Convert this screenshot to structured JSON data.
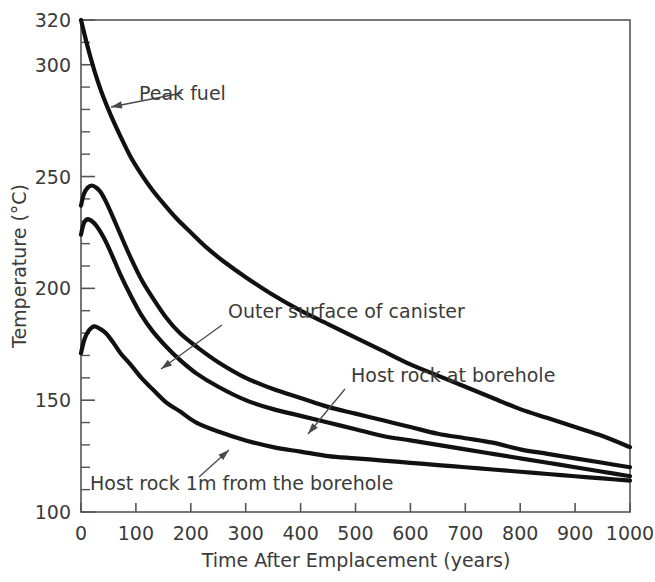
{
  "chart_data": {
    "type": "line",
    "title": "",
    "xlabel": "Time After Emplacement (years)",
    "ylabel": "Temperature (°C)",
    "xlim": [
      0,
      1000
    ],
    "ylim": [
      100,
      320
    ],
    "grid": false,
    "legend_position": "inline-annotations",
    "xticks": [
      0,
      100,
      200,
      300,
      400,
      500,
      600,
      700,
      800,
      900,
      1000
    ],
    "xtick_labels": [
      "0",
      "100",
      "200",
      "300",
      "400",
      "500",
      "600",
      "700",
      "800",
      "900",
      "1000"
    ],
    "yticks": [
      100,
      150,
      200,
      250,
      300,
      320
    ],
    "ytick_labels": [
      "100",
      "150",
      "200",
      "250",
      "300",
      "320"
    ],
    "y_minor_tick_step": 10,
    "series": [
      {
        "name": "Peak fuel",
        "color": "#111111",
        "x": [
          0,
          10,
          20,
          30,
          40,
          55,
          70,
          90,
          110,
          130,
          150,
          175,
          200,
          230,
          260,
          300,
          350,
          400,
          450,
          500,
          550,
          600,
          650,
          700,
          750,
          800,
          850,
          900,
          950,
          1000
        ],
        "y": [
          320,
          310,
          301,
          293,
          286,
          277,
          269,
          259,
          251,
          244,
          238,
          231,
          225,
          218,
          212,
          205,
          197,
          190,
          184,
          178,
          172,
          166,
          161,
          156,
          151,
          146,
          142,
          138,
          134,
          129
        ]
      },
      {
        "name": "Outer surface of canister",
        "color": "#111111",
        "x": [
          0,
          5,
          12,
          20,
          28,
          36,
          45,
          58,
          72,
          90,
          110,
          130,
          155,
          180,
          210,
          250,
          300,
          350,
          400,
          450,
          500,
          550,
          600,
          650,
          700,
          750,
          800,
          850,
          900,
          950,
          1000
        ],
        "y": [
          237,
          242,
          245,
          246,
          245,
          243,
          239,
          232,
          224,
          214,
          204,
          196,
          187,
          180,
          174,
          167,
          160,
          155,
          151,
          147,
          144,
          141,
          138,
          135,
          133,
          131,
          128,
          126,
          124,
          122,
          120
        ]
      },
      {
        "name": "Host rock at borehole",
        "color": "#111111",
        "x": [
          0,
          5,
          12,
          20,
          28,
          36,
          45,
          58,
          72,
          90,
          110,
          130,
          155,
          180,
          210,
          250,
          300,
          350,
          400,
          450,
          500,
          550,
          600,
          650,
          700,
          750,
          800,
          850,
          900,
          950,
          1000
        ],
        "y": [
          224,
          229,
          231,
          230,
          228,
          225,
          221,
          214,
          206,
          197,
          188,
          181,
          174,
          168,
          162,
          156,
          150,
          146,
          143,
          140,
          137,
          134,
          132,
          130,
          128,
          126,
          124,
          122,
          120,
          118,
          116
        ]
      },
      {
        "name": "Host rock 1m from the borehole",
        "color": "#111111",
        "x": [
          0,
          6,
          14,
          24,
          34,
          45,
          58,
          72,
          90,
          110,
          130,
          155,
          180,
          210,
          250,
          300,
          350,
          400,
          450,
          500,
          550,
          600,
          650,
          700,
          750,
          800,
          850,
          900,
          950,
          1000
        ],
        "y": [
          171,
          177,
          181,
          183,
          182,
          180,
          176,
          171,
          166,
          160,
          155,
          149,
          145,
          140,
          136,
          132,
          129,
          127,
          125,
          124,
          123,
          122,
          121,
          120,
          119,
          118,
          117,
          116,
          115,
          114
        ]
      }
    ],
    "annotations": [
      {
        "label": "Peak fuel",
        "text_x": 139,
        "text_y": 100,
        "anchor": "start",
        "arrow_from_x": 182,
        "arrow_from_y": 93,
        "arrow_to_x": 111,
        "arrow_to_y": 107
      },
      {
        "label": "Outer surface of canister",
        "text_x": 228,
        "text_y": 318,
        "anchor": "start",
        "arrow_from_x": 222,
        "arrow_from_y": 325,
        "arrow_to_x": 161,
        "arrow_to_y": 369
      },
      {
        "label": "Host rock at borehole",
        "text_x": 351,
        "text_y": 382,
        "anchor": "start",
        "arrow_from_x": 345,
        "arrow_from_y": 389,
        "arrow_to_x": 308,
        "arrow_to_y": 434
      },
      {
        "label": "Host rock 1m from the borehole",
        "text_x": 90,
        "text_y": 490,
        "anchor": "start",
        "arrow_from_x": 199,
        "arrow_from_y": 477,
        "arrow_to_x": 229,
        "arrow_to_y": 450
      }
    ]
  }
}
